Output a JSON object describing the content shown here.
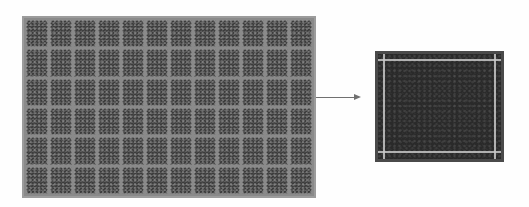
{
  "figure": {
    "mesh_grid": {
      "columns": 12,
      "rows": 6,
      "cell_color": "#3c3c3c",
      "line_color": "#9c9c9c"
    },
    "arrow": {
      "direction": "right",
      "color": "#707070"
    },
    "detail_view": {
      "fill_color": "#2a2a2a",
      "edge_line_color": "#c8c8c8"
    }
  }
}
